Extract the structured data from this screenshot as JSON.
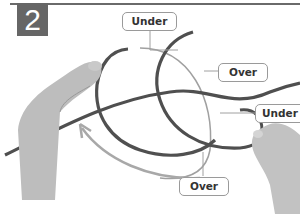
{
  "figure": {
    "step_number": "2",
    "badge_color": "#666666",
    "rope_color": "#555555",
    "guide_color": "#9a9a9a",
    "callouts": [
      {
        "id": "under-top",
        "label": "Under"
      },
      {
        "id": "over-right",
        "label": "Over"
      },
      {
        "id": "under-right",
        "label": "Under"
      },
      {
        "id": "over-bottom",
        "label": "Over"
      }
    ],
    "arrow": {
      "direction": "counter-clockwise",
      "description": "curved guide arrow pointing up-left"
    }
  }
}
